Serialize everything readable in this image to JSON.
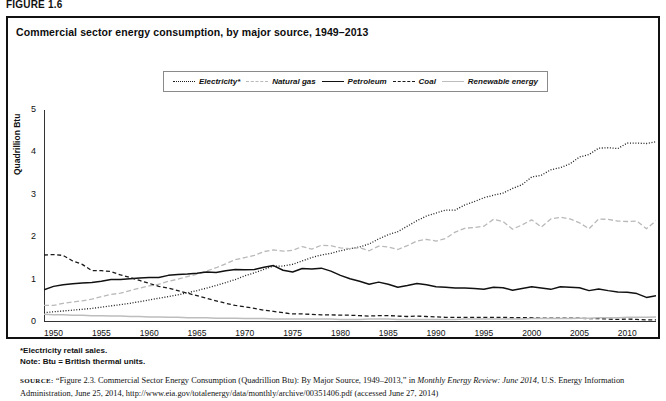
{
  "figure_number": "FIGURE 1.6",
  "figure_title": "Commercial sector energy consumption, by major source, 1949–2013",
  "legend": {
    "items": [
      {
        "label": "Electricity*",
        "style": "dotted",
        "color": "#1a1a1a",
        "icon": "dotted-line-icon"
      },
      {
        "label": "Natural gas",
        "style": "dashed",
        "color": "#b9b9b9",
        "icon": "dashed-line-light-icon"
      },
      {
        "label": "Petroleum",
        "style": "solid",
        "color": "#111111",
        "icon": "solid-line-icon"
      },
      {
        "label": "Coal",
        "style": "dashed",
        "color": "#1a1a1a",
        "icon": "dashed-line-icon"
      },
      {
        "label": "Renewable energy",
        "style": "solid",
        "color": "#bdbdbd",
        "icon": "solid-line-light-icon"
      }
    ]
  },
  "notes": {
    "footnote": "*Electricity retail sales.",
    "note": "Note: Btu = British thermal units."
  },
  "source": {
    "prefix": "SOURCE:",
    "text_1": "“Figure 2.3. Commercial Sector Energy Consumption (Quadrillion Btu): By Major Source, 1949–2013,” in ",
    "italic_1": "Monthly Energy Review: June 2014",
    "text_2": ", U.S. Energy Information Administration, June 25, 2014, http://www.eia.gov/totalenergy/data/monthly/archive/00351406.pdf (accessed June 27, 2014)"
  },
  "chart_data": {
    "type": "line",
    "title": "Commercial sector energy consumption, by major source, 1949–2013",
    "xlabel": "",
    "ylabel": "Quadrillion Btu",
    "xlim": [
      1949,
      2013
    ],
    "ylim": [
      0,
      5
    ],
    "yticks": [
      0,
      1,
      2,
      3,
      4,
      5
    ],
    "xticks": [
      1950,
      1955,
      1960,
      1965,
      1970,
      1975,
      1980,
      1985,
      1990,
      1995,
      2000,
      2005,
      2010
    ],
    "grid": false,
    "legend_position": "top-center",
    "x": [
      1949,
      1950,
      1951,
      1952,
      1953,
      1954,
      1955,
      1956,
      1957,
      1958,
      1959,
      1960,
      1961,
      1962,
      1963,
      1964,
      1965,
      1966,
      1967,
      1968,
      1969,
      1970,
      1971,
      1972,
      1973,
      1974,
      1975,
      1976,
      1977,
      1978,
      1979,
      1980,
      1981,
      1982,
      1983,
      1984,
      1985,
      1986,
      1987,
      1988,
      1989,
      1990,
      1991,
      1992,
      1993,
      1994,
      1995,
      1996,
      1997,
      1998,
      1999,
      2000,
      2001,
      2002,
      2003,
      2004,
      2005,
      2006,
      2007,
      2008,
      2009,
      2010,
      2011,
      2012,
      2013
    ],
    "series": [
      {
        "name": "Electricity*",
        "style": "dotted",
        "color": "#1a1a1a",
        "values": [
          0.22,
          0.24,
          0.26,
          0.28,
          0.3,
          0.32,
          0.35,
          0.38,
          0.41,
          0.44,
          0.48,
          0.52,
          0.56,
          0.6,
          0.64,
          0.69,
          0.74,
          0.8,
          0.86,
          0.93,
          1.0,
          1.09,
          1.16,
          1.24,
          1.32,
          1.32,
          1.36,
          1.44,
          1.52,
          1.58,
          1.62,
          1.68,
          1.73,
          1.77,
          1.84,
          1.96,
          2.06,
          2.13,
          2.26,
          2.39,
          2.5,
          2.57,
          2.64,
          2.64,
          2.76,
          2.84,
          2.93,
          2.99,
          3.04,
          3.15,
          3.24,
          3.42,
          3.46,
          3.59,
          3.64,
          3.73,
          3.89,
          3.95,
          4.1,
          4.11,
          4.09,
          4.22,
          4.22,
          4.21,
          4.25
        ]
      },
      {
        "name": "Natural gas",
        "style": "dashed",
        "color": "#b9b9b9",
        "values": [
          0.39,
          0.39,
          0.44,
          0.47,
          0.5,
          0.54,
          0.6,
          0.65,
          0.68,
          0.74,
          0.8,
          0.85,
          0.89,
          0.96,
          1.01,
          1.07,
          1.13,
          1.2,
          1.28,
          1.37,
          1.47,
          1.52,
          1.57,
          1.66,
          1.7,
          1.67,
          1.69,
          1.78,
          1.72,
          1.81,
          1.8,
          1.75,
          1.73,
          1.75,
          1.68,
          1.79,
          1.77,
          1.71,
          1.8,
          1.91,
          1.95,
          1.91,
          1.97,
          2.12,
          2.21,
          2.23,
          2.26,
          2.42,
          2.37,
          2.19,
          2.29,
          2.41,
          2.24,
          2.43,
          2.47,
          2.43,
          2.34,
          2.2,
          2.43,
          2.42,
          2.38,
          2.37,
          2.38,
          2.2,
          2.39
        ]
      },
      {
        "name": "Petroleum",
        "style": "solid",
        "color": "#111111",
        "values": [
          0.76,
          0.84,
          0.88,
          0.9,
          0.92,
          0.93,
          0.96,
          1.0,
          1.0,
          1.02,
          1.04,
          1.05,
          1.05,
          1.1,
          1.12,
          1.13,
          1.15,
          1.18,
          1.17,
          1.21,
          1.24,
          1.23,
          1.24,
          1.29,
          1.33,
          1.22,
          1.18,
          1.26,
          1.25,
          1.27,
          1.2,
          1.1,
          1.02,
          0.96,
          0.89,
          0.94,
          0.89,
          0.82,
          0.86,
          0.91,
          0.88,
          0.83,
          0.82,
          0.8,
          0.8,
          0.79,
          0.77,
          0.82,
          0.81,
          0.75,
          0.79,
          0.83,
          0.8,
          0.77,
          0.83,
          0.82,
          0.81,
          0.74,
          0.78,
          0.74,
          0.71,
          0.7,
          0.67,
          0.58,
          0.62
        ]
      },
      {
        "name": "Coal",
        "style": "dashed",
        "color": "#1a1a1a",
        "values": [
          1.58,
          1.59,
          1.57,
          1.44,
          1.36,
          1.21,
          1.21,
          1.19,
          1.11,
          1.05,
          0.98,
          0.91,
          0.84,
          0.8,
          0.74,
          0.68,
          0.62,
          0.56,
          0.5,
          0.44,
          0.39,
          0.36,
          0.32,
          0.28,
          0.25,
          0.22,
          0.19,
          0.19,
          0.18,
          0.17,
          0.17,
          0.16,
          0.16,
          0.15,
          0.14,
          0.15,
          0.15,
          0.14,
          0.13,
          0.14,
          0.13,
          0.12,
          0.11,
          0.11,
          0.11,
          0.11,
          0.11,
          0.11,
          0.11,
          0.1,
          0.1,
          0.1,
          0.09,
          0.09,
          0.09,
          0.09,
          0.09,
          0.08,
          0.08,
          0.07,
          0.06,
          0.07,
          0.06,
          0.05,
          0.05
        ]
      },
      {
        "name": "Renewable energy",
        "style": "solid",
        "color": "#bdbdbd",
        "values": [
          0.18,
          0.17,
          0.17,
          0.16,
          0.16,
          0.15,
          0.15,
          0.14,
          0.14,
          0.13,
          0.13,
          0.12,
          0.12,
          0.11,
          0.11,
          0.1,
          0.1,
          0.1,
          0.09,
          0.09,
          0.09,
          0.08,
          0.08,
          0.08,
          0.07,
          0.07,
          0.07,
          0.07,
          0.07,
          0.07,
          0.07,
          0.06,
          0.06,
          0.06,
          0.07,
          0.07,
          0.07,
          0.06,
          0.06,
          0.06,
          0.06,
          0.06,
          0.06,
          0.06,
          0.07,
          0.07,
          0.07,
          0.07,
          0.07,
          0.07,
          0.07,
          0.08,
          0.08,
          0.08,
          0.08,
          0.08,
          0.09,
          0.09,
          0.1,
          0.1,
          0.1,
          0.11,
          0.11,
          0.11,
          0.12
        ]
      }
    ]
  }
}
